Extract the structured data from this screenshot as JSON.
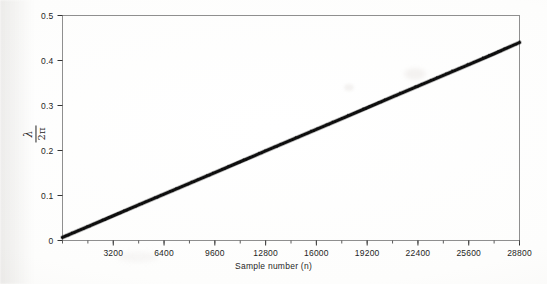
{
  "figure": {
    "background_color": "#fdfdfc",
    "frame_color": "#8a8a8a",
    "data_color": "#111111"
  },
  "axis_title_x": "Sample number (n)",
  "ylabel": {
    "numerator": "λ",
    "denominator": "2π",
    "full": "λ/2π"
  },
  "xticks": [
    "3200",
    "6400",
    "9600",
    "12800",
    "16000",
    "19200",
    "22400",
    "25600",
    "28800"
  ],
  "yticks": [
    "0",
    "0.1",
    "0.2",
    "0.3",
    "0.4",
    "0.5"
  ],
  "chart_data": {
    "type": "line",
    "title": "",
    "subtitle": "",
    "xlabel": "Sample number (n)",
    "ylabel": "λ/2π",
    "xlim": [
      0,
      28800
    ],
    "ylim": [
      0,
      0.5
    ],
    "xticks": [
      3200,
      6400,
      9600,
      12800,
      16000,
      19200,
      22400,
      25600,
      28800
    ],
    "xtick_labels": [
      "3200",
      "6400",
      "9600",
      "12800",
      "16000",
      "19200",
      "22400",
      "25600",
      "28800"
    ],
    "xminor_step": 1600,
    "yticks": [
      0,
      0.1,
      0.2,
      0.3,
      0.4,
      0.5
    ],
    "ytick_labels": [
      "0",
      "0.1",
      "0.2",
      "0.3",
      "0.4",
      "0.5"
    ],
    "grid": false,
    "legend": null,
    "legend_position": "none",
    "annotations": [],
    "line_width_px": 3,
    "series": [
      {
        "name": "λ/2π estimate",
        "x": [
          0,
          1600,
          3200,
          4800,
          6400,
          8000,
          9600,
          11200,
          12800,
          14400,
          16000,
          17600,
          19200,
          20800,
          22400,
          24000,
          25600,
          27200,
          28800
        ],
        "values": [
          0.007,
          0.031,
          0.055,
          0.079,
          0.103,
          0.127,
          0.151,
          0.175,
          0.199,
          0.223,
          0.247,
          0.271,
          0.295,
          0.319,
          0.343,
          0.367,
          0.391,
          0.415,
          0.44
        ]
      }
    ]
  }
}
